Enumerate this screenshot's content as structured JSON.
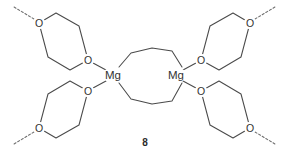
{
  "figure": {
    "compound_number": "8",
    "width": 289,
    "height": 155,
    "background_color": "#ffffff",
    "bond_color": "#4a4a4a",
    "dashed_bond_color": "#6d6d6d",
    "label_color": "#333333"
  },
  "atoms": {
    "metal_label": "Mg",
    "oxygen_label": "O",
    "metal_centers": [
      {
        "id": "mg-left",
        "label": "Mg",
        "x": 113,
        "y": 75
      },
      {
        "id": "mg-right",
        "label": "Mg",
        "x": 176,
        "y": 75
      }
    ],
    "oxygens": [
      {
        "id": "o-tl-outer",
        "label": "O",
        "x": 39,
        "y": 23,
        "ring": "dioxane-top-left"
      },
      {
        "id": "o-tl-inner",
        "label": "O",
        "x": 88,
        "y": 60,
        "ring": "dioxane-top-left"
      },
      {
        "id": "o-tr-outer",
        "label": "O",
        "x": 250,
        "y": 23,
        "ring": "dioxane-top-right"
      },
      {
        "id": "o-tr-inner",
        "label": "O",
        "x": 201,
        "y": 60,
        "ring": "dioxane-top-right"
      },
      {
        "id": "o-bl-outer",
        "label": "O",
        "x": 39,
        "y": 128,
        "ring": "dioxane-bottom-left"
      },
      {
        "id": "o-bl-inner",
        "label": "O",
        "x": 88,
        "y": 91,
        "ring": "dioxane-bottom-left"
      },
      {
        "id": "o-br-outer",
        "label": "O",
        "x": 250,
        "y": 128,
        "ring": "dioxane-bottom-right"
      },
      {
        "id": "o-br-inner",
        "label": "O",
        "x": 201,
        "y": 91,
        "ring": "dioxane-bottom-right"
      }
    ]
  },
  "rings": {
    "dioxane_top_left": {
      "name": "1,4-dioxane ring (top left)",
      "path": "M 39,23 L 56,13 L 79,26 L 88,60 L 70,70 L 48,57 Z"
    },
    "dioxane_top_right": {
      "name": "1,4-dioxane ring (top right)",
      "path": "M 250,23 L 233,13 L 210,26 L 201,60 L 219,70 L 241,57 Z"
    },
    "dioxane_bottom_left": {
      "name": "1,4-dioxane ring (bottom left)",
      "path": "M 39,128 L 56,138 L 79,125 L 88,91 L 70,81 L 48,94 Z"
    },
    "dioxane_bottom_right": {
      "name": "1,4-dioxane ring (bottom right)",
      "path": "M 250,128 L 233,138 L 210,125 L 201,91 L 219,81 L 241,94 Z"
    }
  },
  "bridges": {
    "top_chain": {
      "name": "upper tetramethylene bridge",
      "path": "M 119,67 L 131,53 L 152,48 L 172,51 L 182,67"
    },
    "bottom_chain": {
      "name": "lower tetramethylene bridge",
      "path": "M 119,83 L 131,99 L 152,104 L 172,101 L 182,83"
    }
  },
  "coordination_bonds": [
    {
      "name": "mg-left-to-top-oxygen",
      "path": "M 93,63 L 106,70"
    },
    {
      "name": "mg-left-to-bottom-oxygen",
      "path": "M 93,88 L 106,81"
    },
    {
      "name": "mg-right-to-top-oxygen",
      "path": "M 196,63 L 183,70"
    },
    {
      "name": "mg-right-to-bottom-oxygen",
      "path": "M 196,88 L 183,81"
    }
  ],
  "dashed_bonds": [
    {
      "name": "polymer-continuation-top-left",
      "path": "M 34,19 L 14,7"
    },
    {
      "name": "polymer-continuation-top-right",
      "path": "M 255,19 L 275,7"
    },
    {
      "name": "polymer-continuation-bottom-left",
      "path": "M 34,132 L 14,144"
    },
    {
      "name": "polymer-continuation-bottom-right",
      "path": "M 255,132 L 275,144"
    }
  ],
  "caption": {
    "number": "8",
    "x": 145,
    "y": 142
  }
}
